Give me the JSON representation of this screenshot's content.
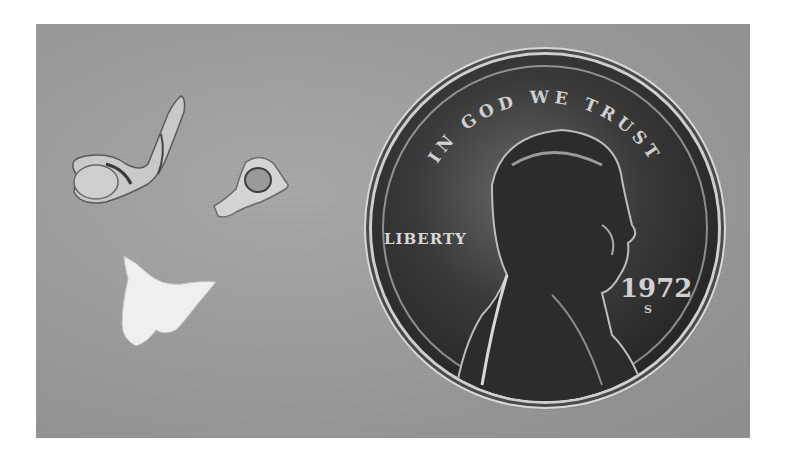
{
  "image": {
    "description": "Black-and-white photograph of three small bones placed next to a U.S. one-cent coin for scale",
    "background_color": "#9c9c9c",
    "objects": [
      {
        "name": "bone-fragment-elongated",
        "desc": "elongated bone with bulbous end, top-left"
      },
      {
        "name": "bone-ring",
        "desc": "small ring-shaped bone, center"
      },
      {
        "name": "bone-triangular",
        "desc": "white triangular bone, lower-left"
      },
      {
        "name": "coin",
        "desc": "Lincoln cent"
      }
    ]
  },
  "coin": {
    "motto": "IN GOD WE TRUST",
    "liberty": "LIBERTY",
    "year": "1972",
    "mint_mark": "S"
  }
}
